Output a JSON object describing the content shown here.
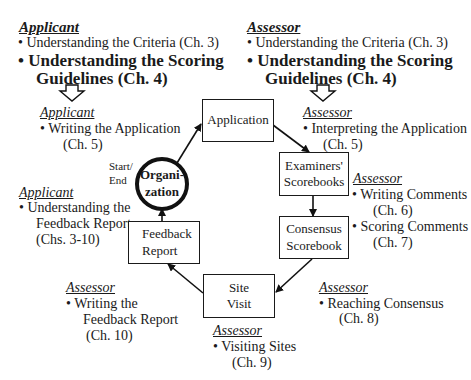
{
  "top_left": {
    "header": "Applicant",
    "items": [
      "Understanding the Criteria (Ch. 3)"
    ],
    "bold_item_line1": "Understanding the Scoring",
    "bold_item_line2": "Guidelines (Ch. 4)"
  },
  "top_right": {
    "header": "Assessor",
    "items": [
      "Understanding the Criteria (Ch. 3)"
    ],
    "bold_item_line1": "Understanding the Scoring",
    "bold_item_line2": "Guidelines (Ch. 4)"
  },
  "annotations": {
    "writing_application": {
      "header": "Applicant",
      "line1": "Writing the Application",
      "line2": "(Ch. 5)"
    },
    "interpreting_application": {
      "header": "Assessor",
      "line1": "Interpreting the Application",
      "line2": "(Ch. 5)"
    },
    "understanding_feedback": {
      "header": "Applicant",
      "line1": "Understanding the",
      "line2": "Feedback Report",
      "line3": "(Chs. 3-10)"
    },
    "writing_scoring_comments": {
      "header": "Assessor",
      "line1": "Writing Comments",
      "line2": "(Ch. 6)",
      "line3": "Scoring Comments",
      "line4": "(Ch. 7)"
    },
    "reaching_consensus": {
      "header": "Assessor",
      "line1": "Reaching Consensus",
      "line2": "(Ch. 8)"
    },
    "writing_feedback": {
      "header": "Assessor",
      "line1": "Writing the",
      "line2": "Feedback Report",
      "line3": "(Ch. 10)"
    },
    "visiting_sites": {
      "header": "Assessor",
      "line1": "Visiting Sites",
      "line2": "(Ch. 9)"
    }
  },
  "nodes": {
    "organization": {
      "line1": "Organi-",
      "line2": "zation"
    },
    "start_end": {
      "line1": "Start/",
      "line2": "End"
    },
    "application": {
      "line1": "Application"
    },
    "examiners_scorebooks": {
      "line1": "Examiners'",
      "line2": "Scorebooks"
    },
    "consensus_scorebook": {
      "line1": "Consensus",
      "line2": "Scorebook"
    },
    "site_visit": {
      "line1": "Site",
      "line2": "Visit"
    },
    "feedback_report": {
      "line1": "Feedback",
      "line2": "Report"
    }
  },
  "bullet": "•"
}
